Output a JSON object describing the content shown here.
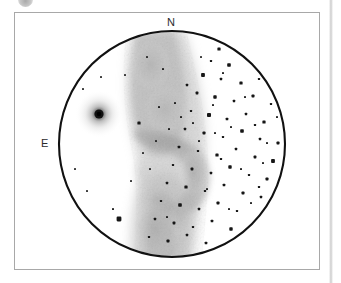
{
  "page": {
    "background_color": "#ffffff",
    "width": 341,
    "height": 283
  },
  "decorations": {
    "top_mark": {
      "name": "page-corner-mark",
      "color": "#bdbdbd",
      "description": "faint grey circular mark cropped at top edge"
    },
    "column_rule": {
      "name": "column-separator-rule",
      "color": "#cfcfcf"
    }
  },
  "figure": {
    "frame": {
      "border_color": "#a8a8a8",
      "background_color": "#ffffff"
    },
    "caption": "",
    "eyepiece_field": {
      "outline_color": "#111111",
      "outline_width": 2.0,
      "center_x": 157,
      "center_y": 131,
      "radius": 113
    },
    "orientation_labels": [
      {
        "text": "N",
        "position": "top",
        "name": "north-label"
      },
      {
        "text": "E",
        "position": "left",
        "name": "east-label"
      }
    ],
    "objects": [
      {
        "name": "globular-cluster",
        "kind": "fuzzy-cluster",
        "x": 84,
        "y": 101,
        "core_radius": 4,
        "halo_radius": 22,
        "color": "#4a4a4a"
      },
      {
        "name": "nebula",
        "kind": "diffuse-nebula",
        "shape": "hourglass / hooked bar running north-south with eastward hook at centre",
        "color": "#b9b9b9",
        "opacity": 0.55
      }
    ],
    "star_field": {
      "color": "#161616",
      "count": 118,
      "note": "small square-ish dots of varying size, densest east (right) of the nebula"
    }
  },
  "chart_data": {
    "type": "scatter",
    "title": "",
    "xlabel": "",
    "ylabel": "",
    "grid": false,
    "legend": "none",
    "stars": [
      [
        204,
        36,
        1.6
      ],
      [
        222,
        32,
        1.3
      ],
      [
        245,
        38,
        1.5
      ],
      [
        258,
        44,
        1.2
      ],
      [
        196,
        48,
        1.1
      ],
      [
        214,
        52,
        1.8
      ],
      [
        233,
        49,
        1.2
      ],
      [
        251,
        57,
        1.1
      ],
      [
        268,
        60,
        1.4
      ],
      [
        188,
        62,
        1.9
      ],
      [
        206,
        66,
        1.2
      ],
      [
        226,
        70,
        1.6
      ],
      [
        244,
        66,
        1.1
      ],
      [
        262,
        73,
        1.3
      ],
      [
        278,
        78,
        1.0
      ],
      [
        182,
        80,
        1.4
      ],
      [
        200,
        84,
        1.7
      ],
      [
        219,
        88,
        1.2
      ],
      [
        238,
        83,
        1.5
      ],
      [
        256,
        91,
        1.1
      ],
      [
        272,
        95,
        1.3
      ],
      [
        286,
        88,
        1.0
      ],
      [
        176,
        98,
        1.1
      ],
      [
        194,
        102,
        2.0
      ],
      [
        212,
        106,
        1.3
      ],
      [
        231,
        101,
        1.2
      ],
      [
        249,
        109,
        1.6
      ],
      [
        266,
        113,
        1.1
      ],
      [
        281,
        104,
        1.4
      ],
      [
        170,
        116,
        1.2
      ],
      [
        189,
        120,
        1.5
      ],
      [
        208,
        124,
        1.1
      ],
      [
        227,
        118,
        1.8
      ],
      [
        245,
        126,
        1.2
      ],
      [
        263,
        130,
        1.5
      ],
      [
        279,
        122,
        1.1
      ],
      [
        164,
        134,
        1.3
      ],
      [
        183,
        138,
        1.1
      ],
      [
        202,
        142,
        1.6
      ],
      [
        221,
        136,
        1.2
      ],
      [
        240,
        144,
        1.4
      ],
      [
        258,
        148,
        1.9
      ],
      [
        275,
        140,
        1.2
      ],
      [
        158,
        152,
        1.1
      ],
      [
        177,
        156,
        1.4
      ],
      [
        196,
        160,
        1.2
      ],
      [
        215,
        154,
        1.7
      ],
      [
        234,
        162,
        1.1
      ],
      [
        252,
        166,
        1.5
      ],
      [
        270,
        158,
        1.2
      ],
      [
        284,
        150,
        1.0
      ],
      [
        152,
        170,
        1.2
      ],
      [
        171,
        174,
        1.6
      ],
      [
        190,
        178,
        1.1
      ],
      [
        209,
        172,
        1.3
      ],
      [
        228,
        180,
        1.5
      ],
      [
        246,
        184,
        1.2
      ],
      [
        264,
        176,
        1.4
      ],
      [
        146,
        188,
        1.1
      ],
      [
        165,
        192,
        1.8
      ],
      [
        184,
        196,
        1.2
      ],
      [
        203,
        190,
        1.5
      ],
      [
        222,
        198,
        1.1
      ],
      [
        240,
        202,
        1.3
      ],
      [
        258,
        194,
        1.6
      ],
      [
        140,
        206,
        1.2
      ],
      [
        159,
        210,
        1.4
      ],
      [
        178,
        214,
        1.1
      ],
      [
        197,
        208,
        1.3
      ],
      [
        216,
        216,
        1.7
      ],
      [
        234,
        220,
        1.2
      ],
      [
        252,
        212,
        1.4
      ],
      [
        134,
        224,
        1.1
      ],
      [
        153,
        228,
        1.5
      ],
      [
        172,
        222,
        1.2
      ],
      [
        191,
        230,
        1.3
      ],
      [
        210,
        234,
        1.6
      ],
      [
        228,
        226,
        1.1
      ],
      [
        104,
        206,
        2.4
      ],
      [
        98,
        196,
        1.0
      ],
      [
        60,
        156,
        0.9
      ],
      [
        72,
        178,
        0.9
      ],
      [
        86,
        64,
        0.9
      ],
      [
        68,
        76,
        0.9
      ],
      [
        110,
        62,
        0.9
      ],
      [
        124,
        110,
        1.6
      ],
      [
        128,
        140,
        0.9
      ],
      [
        116,
        168,
        0.9
      ],
      [
        135,
        156,
        0.9
      ],
      [
        141,
        128,
        0.9
      ],
      [
        148,
        56,
        1.0
      ],
      [
        132,
        44,
        0.9
      ],
      [
        240,
        112,
        1.1
      ],
      [
        208,
        60,
        1.0
      ],
      [
        186,
        44,
        0.9
      ],
      [
        172,
        72,
        1.2
      ],
      [
        160,
        90,
        1.0
      ],
      [
        252,
        130,
        1.0
      ],
      [
        268,
        142,
        1.2
      ],
      [
        274,
        168,
        1.0
      ],
      [
        244,
        174,
        1.1
      ],
      [
        226,
        156,
        1.0
      ],
      [
        206,
        146,
        1.1
      ],
      [
        200,
        120,
        1.0
      ],
      [
        178,
        110,
        1.0
      ],
      [
        192,
        176,
        1.0
      ],
      [
        214,
        196,
        1.0
      ],
      [
        236,
        190,
        1.0
      ],
      [
        248,
        150,
        1.0
      ],
      [
        262,
        104,
        1.0
      ],
      [
        230,
        84,
        1.0
      ],
      [
        216,
        114,
        1.0
      ],
      [
        198,
        92,
        1.0
      ],
      [
        184,
        128,
        1.0
      ],
      [
        166,
        104,
        1.0
      ],
      [
        154,
        116,
        1.0
      ],
      [
        144,
        94,
        1.0
      ],
      [
        152,
        204,
        1.0
      ]
    ]
  }
}
